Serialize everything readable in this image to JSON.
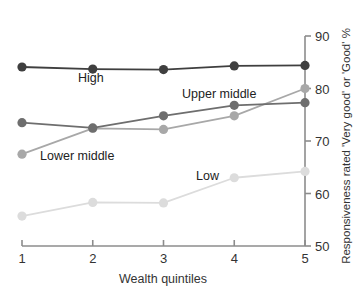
{
  "chart_data": {
    "type": "line",
    "title": "",
    "subtitle": "",
    "xlabel": "Wealth quintiles",
    "ylabel": "Responsiveness rated 'Very good' or 'Good' %",
    "x": [
      1,
      2,
      3,
      4,
      5
    ],
    "categories": [
      "1",
      "2",
      "3",
      "4",
      "5"
    ],
    "xtick_labels": [
      "1",
      "2",
      "3",
      "4",
      "5"
    ],
    "ytick_labels": [
      "50",
      "60",
      "70",
      "80",
      "90"
    ],
    "yticks": [
      50,
      60,
      70,
      80,
      90
    ],
    "ylim": [
      50,
      90
    ],
    "xlim": [
      1,
      5
    ],
    "grid": false,
    "legend_position": "inline-annotations",
    "yaxis_side": "right",
    "series": [
      {
        "name": "High",
        "label": "High",
        "color": "#3f3f3f",
        "values": [
          84.1,
          83.7,
          83.6,
          84.3,
          84.4
        ]
      },
      {
        "name": "Upper middle",
        "label": "Upper middle",
        "color": "#6e6e6e",
        "values": [
          73.5,
          72.5,
          74.8,
          76.8,
          77.3
        ]
      },
      {
        "name": "Lower middle",
        "label": "Lower middle",
        "color": "#a8a8a8",
        "values": [
          67.5,
          72.4,
          72.2,
          74.8,
          80.0
        ]
      },
      {
        "name": "Low",
        "label": "Low",
        "color": "#dcdcdc",
        "values": [
          55.7,
          58.3,
          58.2,
          63.0,
          64.2
        ]
      }
    ],
    "annotations": [
      {
        "text": "High",
        "series": "High",
        "x_px": 78,
        "y_px": 82
      },
      {
        "text": "Upper middle",
        "series": "Upper middle",
        "x_px": 182,
        "y_px": 98
      },
      {
        "text": "Lower middle",
        "series": "Lower middle",
        "x_px": 40,
        "y_px": 160
      },
      {
        "text": "Low",
        "series": "Low",
        "x_px": 196,
        "y_px": 180
      }
    ]
  },
  "axis": {
    "x_title": "Wealth quintiles",
    "y_title": "Responsiveness rated 'Very good' or 'Good' %",
    "x_ticks": [
      "1",
      "2",
      "3",
      "4",
      "5"
    ],
    "y_ticks": [
      "50",
      "60",
      "70",
      "80",
      "90"
    ],
    "axis_color": "#8c8c8c"
  },
  "colors": {
    "high": "#3f3f3f",
    "upper_middle": "#6e6e6e",
    "lower_middle": "#a8a8a8",
    "low": "#dcdcdc",
    "axis": "#8c8c8c",
    "text": "#333333",
    "background": "#ffffff"
  }
}
